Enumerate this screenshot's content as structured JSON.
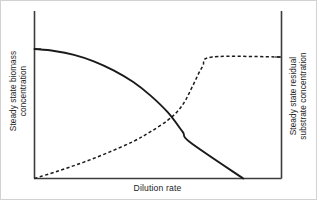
{
  "chart_data": {
    "type": "line",
    "title": "",
    "subtitle": "",
    "xlabel": "Dilution rate",
    "ylabel": "Steady state biomass concentration",
    "y2label": "Steady state residual substrate concentration",
    "grid": false,
    "legend_position": "none",
    "xlim": [
      0,
      1
    ],
    "ylim": [
      0,
      1
    ],
    "y2lim": [
      0,
      1
    ],
    "xticks": [],
    "yticks": [],
    "axis_ticks": {
      "left_tick_value": 1.0,
      "right_tick_value": 1.0
    },
    "series": [
      {
        "name": "Steady state biomass concentration",
        "style": "solid",
        "color": "#1a1a1a",
        "axis": "left",
        "x": [
          0.0,
          0.08,
          0.16,
          0.24,
          0.32,
          0.4,
          0.47,
          0.54,
          0.6,
          0.63,
          0.845
        ],
        "values": [
          1.0,
          0.985,
          0.955,
          0.905,
          0.835,
          0.745,
          0.64,
          0.51,
          0.36,
          0.28,
          0.0
        ]
      },
      {
        "name": "Steady state residual substrate concentration",
        "style": "dashed",
        "color": "#1a1a1a",
        "axis": "right",
        "x": [
          0.0,
          0.1,
          0.2,
          0.3,
          0.4,
          0.47,
          0.54,
          0.58,
          0.61,
          0.64,
          0.68,
          0.72,
          1.0
        ],
        "values": [
          0.0,
          0.065,
          0.135,
          0.215,
          0.305,
          0.385,
          0.48,
          0.555,
          0.64,
          0.76,
          0.92,
          1.0,
          1.0
        ]
      }
    ],
    "annotations": {
      "crossover_x": 0.465,
      "crossover_note": "solid biomass curve crosses dashed substrate curve",
      "washout_x": 0.845,
      "washout_note": "biomass falls to zero (washout); substrate plateaus at inlet value"
    }
  },
  "labels": {
    "y_left_line1": "Steady state biomass",
    "y_left_line2": "concentration",
    "y_right_line1": "Steady state residual",
    "y_right_line2": "substrate concentration",
    "x_axis": "Dilution rate"
  },
  "colors": {
    "ink": "#1a1a1a",
    "axis": "#3c3c3c",
    "background": "#ffffff",
    "border": "#d2d2d2"
  }
}
